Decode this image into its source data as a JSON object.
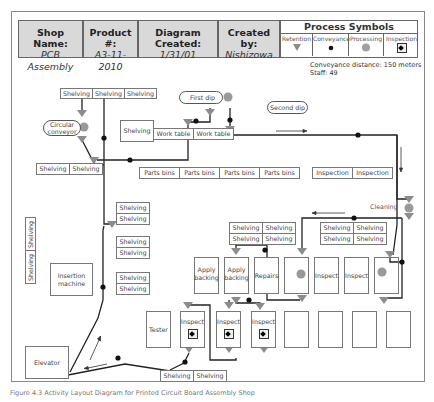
{
  "header": {
    "shop_name_label": "Shop Name:",
    "shop_name_value": "PCB Assembly",
    "product_label": "Product #:",
    "product_value": "A3-11-2010",
    "diagram_created_label": "Diagram Created:",
    "diagram_created_value": "1/31/01",
    "created_by_label": "Created by:",
    "created_by_value": "Nishizowa"
  },
  "process_symbols": {
    "title": "Process Symbols",
    "items": [
      {
        "label": "Retention",
        "icon": "triangle-down-icon"
      },
      {
        "label": "Conveyance",
        "icon": "dot-icon"
      },
      {
        "label": "Processing",
        "icon": "circle-icon"
      },
      {
        "label": "Inspection",
        "icon": "diamond-square-icon"
      }
    ]
  },
  "meta": {
    "conveyance_distance": "Conveyance distance: 150 meters",
    "staff": "Staff: 49"
  },
  "layout": {
    "shelving": "Shelving",
    "circular_conveyor": "Circular conveyor",
    "first_dip": "First dip",
    "second_dip": "Second dip",
    "work_table": "Work table",
    "parts_bins": "Parts bins",
    "inspection": "Inspection",
    "cleaning": "Cleaning",
    "insertion_machine": "Insertion machine",
    "apply_backing": "Apply backing",
    "repairs": "Repairs",
    "inspect": "Inspect",
    "tester": "Tester",
    "elevator": "Elevator"
  },
  "colors": {
    "retention": "#8c8c8c",
    "processing": "#999999",
    "line": "#222222",
    "header_bg": "#d9d9d9"
  },
  "caption": "Figure 4.3  Activity Layout Diagram for Printed Circuit Board Assembly Shop"
}
